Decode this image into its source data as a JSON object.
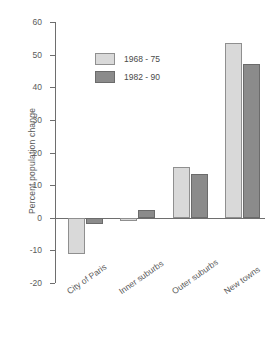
{
  "chart_data": {
    "type": "bar",
    "title": "",
    "subtitle": "",
    "xlabel": "",
    "ylabel": "Percent population change",
    "categories": [
      "City of Paris",
      "Inner suburbs",
      "Outer suburbs",
      "New towns"
    ],
    "series": [
      {
        "name": "1968 - 75",
        "color": "#d9d9d9",
        "values": [
          -11.0,
          -1.0,
          15.5,
          53.5
        ]
      },
      {
        "name": "1982 - 90",
        "color": "#8b8b8b",
        "values": [
          -2.0,
          2.5,
          13.5,
          47.0
        ]
      }
    ],
    "ylim": [
      -20,
      60
    ],
    "yticks": [
      60,
      50,
      40,
      30,
      20,
      10,
      0,
      -10,
      -20
    ],
    "ytick_labels": [
      "60",
      "50",
      "40",
      "30",
      "20",
      "10",
      "0",
      "-10",
      "-20"
    ],
    "grid": false,
    "legend_position": "upper-left-inside",
    "zero_line": true
  },
  "colors": {
    "series_1968_75": "#d9d9d9",
    "series_1982_90": "#8b8b8b",
    "axis": "#6e6e6e",
    "text": "#5a5a5a",
    "background": "#ffffff"
  }
}
